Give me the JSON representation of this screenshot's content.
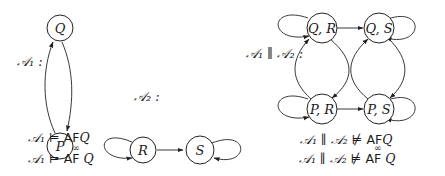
{
  "automata": [
    {
      "name": "A1",
      "label": "𝒜₁ :",
      "states": [
        "Q",
        "P"
      ],
      "transitions": [
        [
          "Q",
          "P"
        ],
        [
          "P",
          "Q"
        ]
      ],
      "properties": [
        {
          "lhs": "𝒜₁",
          "rel": "⊨",
          "op": "AF",
          "target": "Q",
          "infinitely": false
        },
        {
          "lhs": "𝒜₁",
          "rel": "⊨",
          "op": "AF",
          "target": "Q",
          "infinitely": true
        }
      ]
    },
    {
      "name": "A2",
      "label": "𝒜₂ :",
      "states": [
        "R",
        "S"
      ],
      "transitions": [
        [
          "R",
          "R"
        ],
        [
          "R",
          "S"
        ],
        [
          "S",
          "S"
        ]
      ]
    },
    {
      "name": "A1_par_A2",
      "label": "𝒜₁ ∥ 𝒜₂ :",
      "states": [
        "Q, R",
        "Q, S",
        "P, R",
        "P, S"
      ],
      "transitions": [
        [
          "Q, R",
          "Q, R"
        ],
        [
          "Q, R",
          "Q, S"
        ],
        [
          "Q, S",
          "Q, S"
        ],
        [
          "Q, R",
          "P, R"
        ],
        [
          "P, R",
          "Q, R"
        ],
        [
          "Q, S",
          "P, S"
        ],
        [
          "P, S",
          "Q, S"
        ],
        [
          "P, R",
          "P, R"
        ],
        [
          "P, R",
          "P, S"
        ],
        [
          "P, S",
          "P, S"
        ]
      ],
      "properties": [
        {
          "lhs": "𝒜₁ ∥ 𝒜₂",
          "rel": "⊭",
          "op": "AF",
          "target": "Q",
          "infinitely": false
        },
        {
          "lhs": "𝒜₁ ∥ 𝒜₂",
          "rel": "⊭",
          "op": "AF",
          "target": "Q",
          "infinitely": true
        }
      ]
    }
  ],
  "infinity_mark": "∞"
}
